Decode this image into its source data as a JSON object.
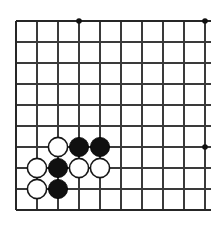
{
  "figure": {
    "board_type": "go-board",
    "background_color": "#ffffff",
    "line_color": "#3a3a3a",
    "border_color": "#262626",
    "black_stone_color": "#101010",
    "white_stone_color": "#ffffff"
  },
  "board": {
    "origin_x": 16,
    "origin_y": 21,
    "spacing": 21,
    "columns": 10,
    "rows": 10,
    "stone_radius": 9.6,
    "star_point_radius": 2.8,
    "edges": {
      "left": "thick",
      "top": "thick",
      "bottom": "thick",
      "right": "cut-off"
    },
    "vertical_line_x": [
      16,
      37,
      58,
      79,
      100,
      121,
      142,
      163,
      184,
      205
    ],
    "horizontal_line_y": [
      21,
      42,
      63,
      84,
      105,
      126,
      147,
      168,
      189,
      210
    ],
    "line_overhang": 6
  },
  "star_points": [
    {
      "name": "star-point-top-left",
      "x": 79,
      "y": 21
    },
    {
      "name": "star-point-top-right",
      "x": 205,
      "y": 21
    },
    {
      "name": "star-point-center-right",
      "x": 205,
      "y": 147
    }
  ],
  "stones": [
    {
      "name": "white-stone-c4",
      "color": "white",
      "x": 58,
      "y": 147,
      "col": 2,
      "row": 6
    },
    {
      "name": "black-stone-d4",
      "color": "black",
      "x": 79,
      "y": 147,
      "col": 3,
      "row": 6
    },
    {
      "name": "black-stone-e4",
      "color": "black",
      "x": 100,
      "y": 147,
      "col": 4,
      "row": 6
    },
    {
      "name": "white-stone-b3",
      "color": "white",
      "x": 37,
      "y": 168,
      "col": 1,
      "row": 7
    },
    {
      "name": "black-stone-c3",
      "color": "black",
      "x": 58,
      "y": 168,
      "col": 2,
      "row": 7
    },
    {
      "name": "white-stone-d3",
      "color": "white",
      "x": 79,
      "y": 168,
      "col": 3,
      "row": 7
    },
    {
      "name": "white-stone-e3",
      "color": "white",
      "x": 100,
      "y": 168,
      "col": 4,
      "row": 7
    },
    {
      "name": "white-stone-b2",
      "color": "white",
      "x": 37,
      "y": 189,
      "col": 1,
      "row": 8
    },
    {
      "name": "black-stone-c2",
      "color": "black",
      "x": 58,
      "y": 189,
      "col": 2,
      "row": 8
    }
  ],
  "counts": {
    "black_stones": 4,
    "white_stones": 5,
    "total_stones": 9
  }
}
